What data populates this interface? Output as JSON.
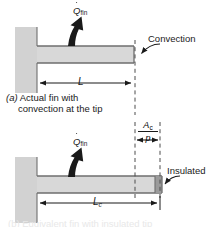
{
  "figure": {
    "title_semantic": "Fin heat transfer: actual fin with tip convection vs equivalent insulated-tip fin",
    "colors": {
      "wall_fill": "#d2d2d2",
      "fin_fill": "#d8d8d8",
      "insulated_tip_fill": "#9a9a9a",
      "outline": "#6e6e6e",
      "ink": "#1a1a1a",
      "dashed": "#4d4d4d",
      "background": "#ffffff"
    },
    "panel_a": {
      "heat_flow_label": {
        "symbol": "Q",
        "dot": true,
        "subscript": "fin"
      },
      "tip_annotation": "Convection",
      "dimension_label": {
        "symbol": "L",
        "subscript": ""
      },
      "caption_id": "(a)",
      "caption_line1": "Actual fin with",
      "caption_line2": "convection at the tip"
    },
    "panel_b": {
      "heat_flow_label": {
        "symbol": "Q",
        "dot": true,
        "subscript": "fin"
      },
      "tip_annotation": "Insulated",
      "dimension_label": {
        "symbol": "L",
        "subscript": "c"
      },
      "extension_fraction": {
        "numerator_symbol": "A",
        "numerator_subscript": "c",
        "denominator_symbol": "p"
      },
      "caption_cut_off": "(b) Equivalent fin with insulated tip"
    }
  }
}
